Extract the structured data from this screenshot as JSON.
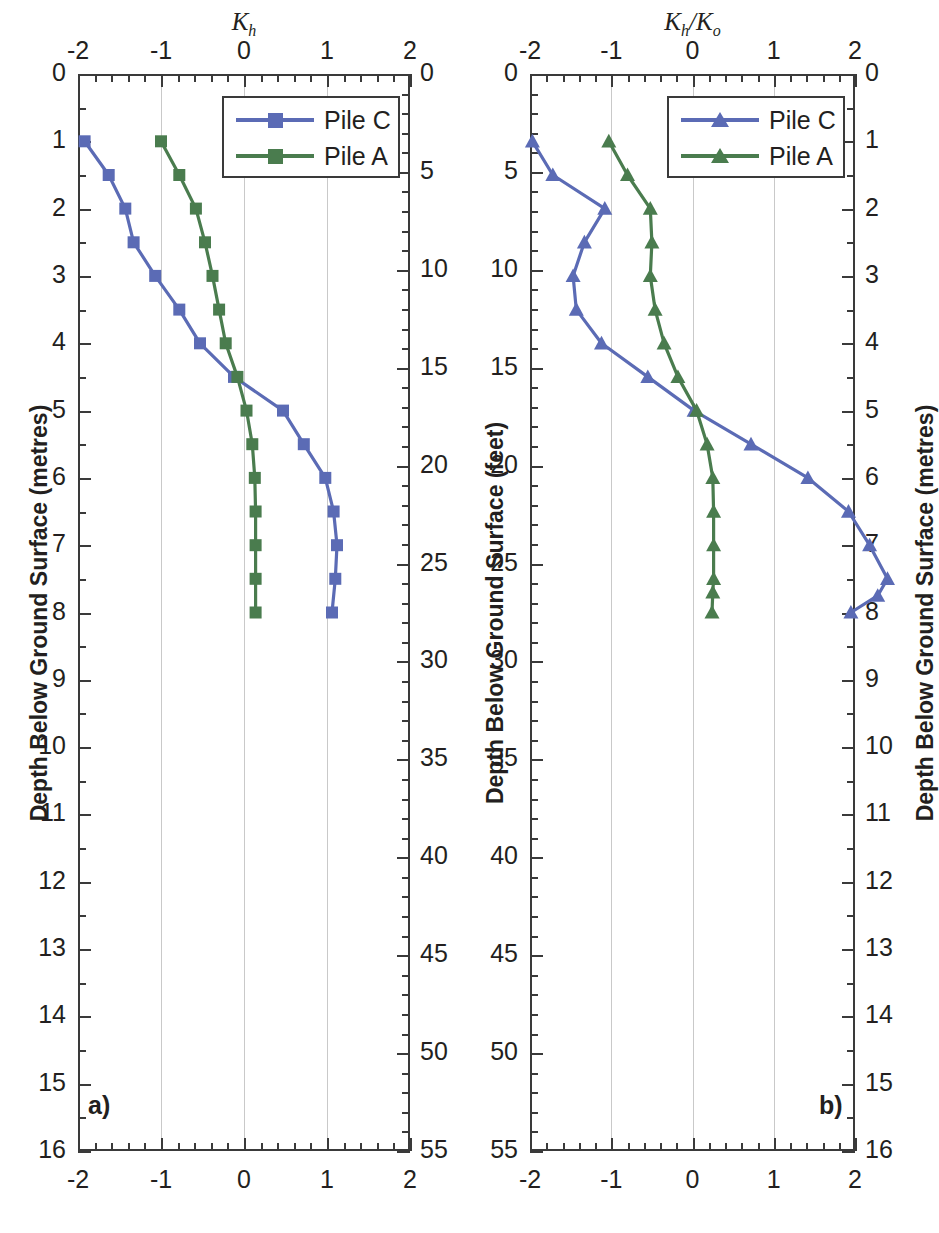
{
  "figure": {
    "panel_a_label": "a)",
    "panel_b_label": "b)",
    "colors": {
      "pile_c": "#5B6BB5",
      "pile_a": "#4A7C4E",
      "axis": "#3a3a3a",
      "grid": "#c9c9c9"
    }
  },
  "panel_a": {
    "title_main": "K",
    "title_sub": "h",
    "left_axis_title": "Depth Below Ground Surface (metres)",
    "right_axis_title": "Depth Below Ground Surface (feet)",
    "x_ticks": [
      "-2",
      "-1",
      "0",
      "1",
      "2"
    ],
    "y_left_ticks": [
      "0",
      "1",
      "2",
      "3",
      "4",
      "5",
      "6",
      "7",
      "8",
      "9",
      "10",
      "11",
      "12",
      "13",
      "14",
      "15",
      "16"
    ],
    "y_right_ticks": [
      "0",
      "5",
      "10",
      "15",
      "20",
      "25",
      "30",
      "35",
      "40",
      "45",
      "50",
      "55"
    ],
    "legend": [
      {
        "label": "Pile C",
        "color": "#5B6BB5",
        "marker": "square"
      },
      {
        "label": "Pile A",
        "color": "#4A7C4E",
        "marker": "square"
      }
    ]
  },
  "panel_b": {
    "title_main": "K",
    "title_sub": "h",
    "title_main2": "K",
    "title_sub2": "o",
    "title_sep": "/",
    "left_axis_title": "Depth Below Ground Surface (feet)",
    "right_axis_title": "Depth Below Ground Surface (metres)",
    "x_ticks": [
      "-2",
      "-1",
      "0",
      "1",
      "2"
    ],
    "y_left_ticks": [
      "0",
      "5",
      "10",
      "15",
      "20",
      "25",
      "30",
      "35",
      "40",
      "45",
      "50",
      "55"
    ],
    "y_right_ticks": [
      "0",
      "1",
      "2",
      "3",
      "4",
      "5",
      "6",
      "7",
      "8",
      "9",
      "10",
      "11",
      "12",
      "13",
      "14",
      "15",
      "16"
    ],
    "legend": [
      {
        "label": "Pile C",
        "color": "#5B6BB5",
        "marker": "triangle"
      },
      {
        "label": "Pile A",
        "color": "#4A7C4E",
        "marker": "triangle"
      }
    ]
  },
  "chart_data": [
    {
      "panel": "a)",
      "type": "line",
      "title": "Kh",
      "xlabel": "K_h",
      "ylabel": "Depth Below Ground Surface (metres)",
      "ylabel_secondary": "Depth Below Ground Surface (feet)",
      "xlim": [
        -2,
        2
      ],
      "ylim_metres": [
        0,
        16
      ],
      "ylim_feet": [
        0,
        55
      ],
      "xticks": [
        -2,
        -1,
        0,
        1,
        2
      ],
      "yticks_metres": [
        0,
        1,
        2,
        3,
        4,
        5,
        6,
        7,
        8,
        9,
        10,
        11,
        12,
        13,
        14,
        15,
        16
      ],
      "yticks_feet": [
        0,
        5,
        10,
        15,
        20,
        25,
        30,
        35,
        40,
        45,
        50,
        55
      ],
      "grid": "vertical",
      "legend_position": "top-right",
      "y_inverted": true,
      "series": [
        {
          "name": "Pile C",
          "color": "#5B6BB5",
          "marker": "square",
          "x": [
            -1.92,
            -1.63,
            -1.43,
            -1.33,
            -1.07,
            -0.78,
            -0.53,
            -0.12,
            0.47,
            0.72,
            0.98,
            1.08,
            1.12,
            1.1,
            1.06
          ],
          "depth_m": [
            1.0,
            1.5,
            2.0,
            2.5,
            3.0,
            3.5,
            4.0,
            4.5,
            5.0,
            5.5,
            6.0,
            6.5,
            7.0,
            7.5,
            8.0
          ]
        },
        {
          "name": "Pile A",
          "color": "#4A7C4E",
          "marker": "square",
          "x": [
            -1.0,
            -0.78,
            -0.58,
            -0.47,
            -0.38,
            -0.3,
            -0.22,
            -0.08,
            0.03,
            0.1,
            0.13,
            0.14,
            0.14,
            0.14,
            0.14
          ],
          "depth_m": [
            1.0,
            1.5,
            2.0,
            2.5,
            3.0,
            3.5,
            4.0,
            4.5,
            5.0,
            5.5,
            6.0,
            6.5,
            7.0,
            7.5,
            8.0
          ]
        }
      ]
    },
    {
      "panel": "b)",
      "type": "line",
      "title": "Kh/Ko",
      "xlabel": "K_h/K_o",
      "ylabel": "Depth Below Ground Surface (feet)",
      "ylabel_secondary": "Depth Below Ground Surface (metres)",
      "xlim": [
        -2,
        2
      ],
      "ylim_feet": [
        0,
        55
      ],
      "ylim_metres": [
        0,
        16
      ],
      "xticks": [
        -2,
        -1,
        0,
        1,
        2
      ],
      "yticks_feet": [
        0,
        5,
        10,
        15,
        20,
        25,
        30,
        35,
        40,
        45,
        50,
        55
      ],
      "yticks_metres": [
        0,
        1,
        2,
        3,
        4,
        5,
        6,
        7,
        8,
        9,
        10,
        11,
        12,
        13,
        14,
        15,
        16
      ],
      "grid": "vertical",
      "legend_position": "top-right",
      "y_inverted": true,
      "series": [
        {
          "name": "Pile C",
          "color": "#5B6BB5",
          "marker": "triangle",
          "x": [
            -1.97,
            -1.72,
            -1.08,
            -1.33,
            -1.47,
            -1.43,
            -1.12,
            -0.55,
            0.02,
            0.72,
            1.42,
            1.92,
            2.18,
            2.4,
            2.28,
            1.95
          ],
          "depth_ft": [
            3.3,
            4.9,
            6.6,
            8.2,
            9.8,
            11.5,
            13.1,
            14.8,
            16.4,
            18.0,
            19.7,
            21.3,
            23.0,
            24.6,
            26.2,
            26.2
          ],
          "depth_m": [
            1.0,
            1.5,
            2.0,
            2.5,
            3.0,
            3.5,
            4.0,
            4.5,
            5.0,
            5.5,
            6.0,
            6.5,
            7.0,
            7.5,
            7.75,
            8.0
          ]
        },
        {
          "name": "Pile A",
          "color": "#4A7C4E",
          "marker": "triangle",
          "x": [
            -1.03,
            -0.8,
            -0.52,
            -0.5,
            -0.52,
            -0.46,
            -0.35,
            -0.18,
            0.05,
            0.18,
            0.25,
            0.26,
            0.26,
            0.26,
            0.25,
            0.24
          ],
          "depth_ft": [
            3.3,
            4.9,
            6.6,
            8.2,
            9.8,
            11.5,
            13.1,
            14.8,
            16.4,
            18.0,
            19.7,
            21.3,
            23.0,
            24.6,
            25.3,
            26.2
          ],
          "depth_m": [
            1.0,
            1.5,
            2.0,
            2.5,
            3.0,
            3.5,
            4.0,
            4.5,
            5.0,
            5.5,
            6.0,
            6.5,
            7.0,
            7.5,
            7.7,
            8.0
          ]
        }
      ]
    }
  ]
}
